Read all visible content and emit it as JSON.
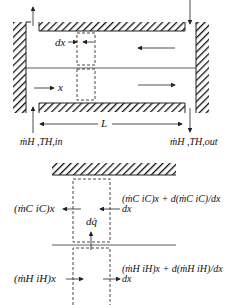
{
  "top_diagram": {
    "labels": {
      "dx": "dx",
      "x": "x",
      "L": "L",
      "inlet_label": "ṁH ,TH,in",
      "outlet_label": "ṁH ,TH,out",
      "top_left_clipped": "ṁC ,TC,out",
      "top_right_clipped": "ṁC ,TC,in"
    }
  },
  "bottom_diagram": {
    "labels": {
      "cold_in_left": "(ṁC iC)x",
      "cold_right": "(ṁC iC)x + d(ṁC iC)/dx dx",
      "dq": "dq̇",
      "hot_left": "(ṁH iH)x",
      "hot_right": "(ṁH iH)x + d(ṁH iH)/dx dx"
    }
  },
  "colors": {
    "line": "#222222",
    "background": "#ffffff"
  }
}
